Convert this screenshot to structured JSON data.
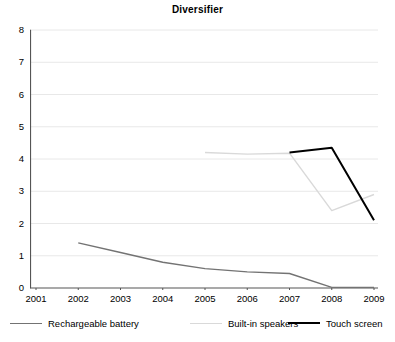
{
  "chart": {
    "title": "Diversifier"
  },
  "chart_data": {
    "type": "line",
    "title": "Diversifier",
    "xlabel": "",
    "ylabel": "",
    "x": [
      2001,
      2002,
      2003,
      2004,
      2005,
      2006,
      2007,
      2008,
      2009
    ],
    "categories": [
      "2001",
      "2002",
      "2003",
      "2004",
      "2005",
      "2006",
      "2007",
      "2008",
      "2009"
    ],
    "xlim": [
      2001,
      2009
    ],
    "ylim": [
      0,
      8
    ],
    "yticks": [
      0,
      1,
      2,
      3,
      4,
      5,
      6,
      7,
      8
    ],
    "ytick_labels": [
      "0",
      "1",
      "2",
      "3",
      "4",
      "5",
      "6",
      "7",
      "8"
    ],
    "grid": true,
    "grid_axis": "y",
    "legend_position": "bottom",
    "series": [
      {
        "name": "Rechargeable battery",
        "color": "#737373",
        "x": [
          2002,
          2003,
          2004,
          2005,
          2006,
          2007,
          2008,
          2009
        ],
        "values": [
          1.4,
          1.1,
          0.8,
          0.6,
          0.5,
          0.45,
          0.02,
          0.02
        ]
      },
      {
        "name": "Built-in speakers",
        "color": "#d9d9d9",
        "x": [
          2005,
          2006,
          2007,
          2008,
          2009
        ],
        "values": [
          4.2,
          4.15,
          4.18,
          2.4,
          2.9
        ]
      },
      {
        "name": "Touch screen",
        "color": "#000000",
        "x": [
          2007,
          2008,
          2009
        ],
        "values": [
          4.2,
          4.35,
          2.1
        ]
      }
    ]
  },
  "legend": {
    "items": [
      {
        "label": "Rechargeable battery",
        "color": "#737373"
      },
      {
        "label": "Built-in speakers",
        "color": "#d9d9d9"
      },
      {
        "label": "Touch screen",
        "color": "#000000"
      }
    ]
  }
}
